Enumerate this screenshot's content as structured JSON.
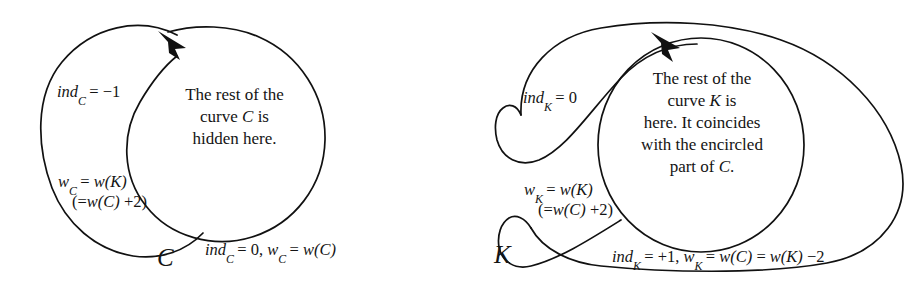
{
  "figure": {
    "background_color": "#ffffff",
    "stroke_color": "#111111",
    "text_color": "#141414",
    "panels": [
      {
        "id": "left",
        "curve_label": "C",
        "inner_text_lines": [
          "The rest of the",
          "curve C is",
          "hidden here."
        ],
        "inner_text_plain": "The rest of the curve C is hidden here.",
        "annotations": [
          {
            "name": "index-outer-left",
            "lines": [
              "ind_C = −1"
            ],
            "plain": "ind_C = −1"
          },
          {
            "name": "winding-outer-left",
            "lines": [
              "w_C = w(K)",
              "(=w(C) +2)"
            ],
            "plain": "w_C = w(K)  (=w(C) +2)"
          },
          {
            "name": "index-outside-bottom",
            "lines": [
              "ind_C = 0, w_C = w(C)"
            ],
            "plain": "ind_C = 0, w_C = w(C)"
          }
        ]
      },
      {
        "id": "right",
        "curve_label": "K",
        "inner_text_lines": [
          "The rest of the",
          "curve K is",
          "here. It coincides",
          "with the encircled",
          "part of C."
        ],
        "inner_text_plain": "The rest of the curve K is here. It coincides with the encircled part of C.",
        "annotations": [
          {
            "name": "index-outer-left",
            "lines": [
              "ind_K = 0"
            ],
            "plain": "ind_K = 0"
          },
          {
            "name": "winding-outer-left",
            "lines": [
              "w_K = w(K)",
              "(=w(C) +2)"
            ],
            "plain": "w_K = w(K)  (=w(C) +2)"
          },
          {
            "name": "index-outside-bottom",
            "lines": [
              "ind_K = +1, w_K = w(C) = w(K) −2"
            ],
            "plain": "ind_K = +1, w_K = w(C) = w(K) −2"
          }
        ]
      }
    ]
  },
  "left": {
    "curve_label": "C",
    "blurb": {
      "l1": "The rest of the",
      "l2a": "curve ",
      "l2b": "C",
      "l2c": " is",
      "l3": "hidden here."
    },
    "ind_top": {
      "name": "ind",
      "sub": "C",
      "rest": "= −1"
    },
    "w_mid": {
      "wsym": "w",
      "sub": "C",
      "eq": "= ",
      "wk": "w",
      "kpar": "(K)",
      "line2_a": "(=",
      "line2_w": "w",
      "line2_c": "(C)",
      "line2_t": " +2)"
    },
    "bottom": {
      "ind": "ind",
      "sub1": "C",
      "mid": "= 0, ",
      "w": "w",
      "sub2": "C",
      "eq": "= ",
      "wfn": "w",
      "arg": "(C)"
    }
  },
  "right": {
    "curve_label": "K",
    "blurb": {
      "l1": "The rest of the",
      "l2a": "curve ",
      "l2b": "K",
      "l2c": " is",
      "l3": "here. It coincides",
      "l4": "with the encircled",
      "l5a": "part of ",
      "l5b": "C",
      "l5c": "."
    },
    "ind_top": {
      "name": "ind",
      "sub": "K",
      "rest": "= 0"
    },
    "w_mid": {
      "wsym": "w",
      "sub": "K",
      "eq": "= ",
      "wk": "w",
      "kpar": "(K)",
      "line2_a": "(=",
      "line2_w": "w",
      "line2_c": "(C)",
      "line2_t": " +2)"
    },
    "bottom": {
      "ind": "ind",
      "sub1": "K",
      "mid": "= +1, ",
      "w": "w",
      "sub2": "K",
      "eq": "= ",
      "wfn1": "w",
      "arg1": "(C)",
      "eq2": " = ",
      "wfn2": "w",
      "arg2": "(K)",
      "tail": " −2"
    }
  }
}
